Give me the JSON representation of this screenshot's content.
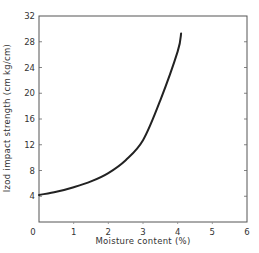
{
  "chart_data": {
    "type": "line",
    "title": "",
    "xlabel": "Moisture content (%)",
    "ylabel": "Izod impact strength (cm kg/cm)",
    "xlim": [
      0,
      6
    ],
    "ylim": [
      0,
      32
    ],
    "x_ticks": [
      0,
      1,
      2,
      3,
      4,
      5,
      6
    ],
    "y_ticks": [
      4,
      8,
      12,
      16,
      20,
      24,
      28,
      32
    ],
    "grid": false,
    "legend": null,
    "series": [
      {
        "name": "Izod impact strength vs moisture",
        "x": [
          0,
          0.5,
          1,
          1.5,
          2,
          2.5,
          3,
          3.5,
          4,
          4.1
        ],
        "y": [
          4.2,
          4.7,
          5.4,
          6.3,
          7.6,
          9.6,
          12.7,
          18.9,
          26.5,
          29.3
        ],
        "color": "#222222"
      }
    ]
  }
}
